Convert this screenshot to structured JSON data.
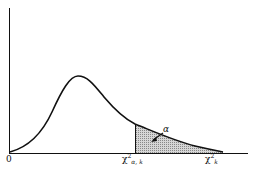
{
  "diagram": {
    "title": "",
    "type": "chi-square density with upper tail area",
    "labels": {
      "origin": "0",
      "critical_value_base": "χ",
      "critical_value_sup": "2",
      "critical_value_sub": "α, k",
      "axis_var_base": "χ",
      "axis_var_sup": "2",
      "axis_var_sub": "k",
      "tail_area": "α"
    },
    "colors": {
      "curve": "#111111",
      "shade": "#bdbdbd"
    }
  }
}
